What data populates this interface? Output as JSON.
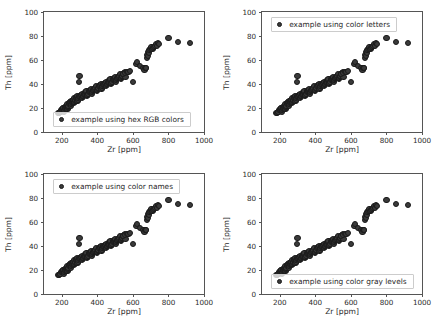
{
  "figure": {
    "width": 436,
    "height": 330,
    "background": "#ffffff",
    "marker_color": "#3a3a3a",
    "marker_edge_color": "#1a1a1a",
    "spine_color": "#555555",
    "caption": ""
  },
  "chart_data": [
    {
      "type": "scatter",
      "title": "",
      "xlabel": "Zr [ppm]",
      "ylabel": "Th [ppm]",
      "xlim": [
        100,
        1000
      ],
      "ylim": [
        0,
        100
      ],
      "xticks": [
        200,
        400,
        600,
        800,
        1000
      ],
      "yticks": [
        0,
        20,
        40,
        60,
        80,
        100
      ],
      "grid": false,
      "legend": {
        "label": "example using hex RGB colors",
        "position": "lower left"
      },
      "x": [
        182,
        186,
        190,
        193,
        196,
        199,
        202,
        205,
        208,
        210,
        212,
        214,
        216,
        219,
        221,
        223,
        225,
        228,
        230,
        232,
        234,
        236,
        238,
        240,
        242,
        244,
        246,
        248,
        250,
        252,
        254,
        256,
        258,
        260,
        262,
        264,
        266,
        268,
        270,
        272,
        274,
        276,
        278,
        280,
        282,
        284,
        286,
        288,
        290,
        292,
        295,
        298,
        300,
        303,
        306,
        309,
        312,
        315,
        318,
        321,
        324,
        327,
        330,
        333,
        336,
        339,
        342,
        345,
        348,
        351,
        354,
        357,
        360,
        363,
        366,
        369,
        372,
        375,
        378,
        381,
        384,
        387,
        390,
        393,
        396,
        399,
        402,
        405,
        408,
        411,
        414,
        417,
        420,
        423,
        426,
        429,
        432,
        435,
        438,
        441,
        444,
        447,
        450,
        453,
        456,
        459,
        462,
        465,
        468,
        471,
        474,
        477,
        480,
        483,
        486,
        489,
        492,
        495,
        498,
        501,
        504,
        507,
        510,
        513,
        516,
        519,
        522,
        525,
        528,
        531,
        534,
        537,
        540,
        543,
        546,
        549,
        552,
        555,
        558,
        300,
        545,
        555,
        565,
        575,
        585,
        600,
        620,
        625,
        640,
        660,
        665,
        670,
        672,
        675,
        678,
        681,
        684,
        687,
        690,
        693,
        696,
        700,
        705,
        710,
        715,
        720,
        725,
        730,
        735,
        740,
        745,
        800,
        855,
        920
      ],
      "y": [
        16,
        16,
        17,
        17,
        18,
        18,
        19,
        19,
        20,
        20,
        17,
        18,
        19,
        20,
        21,
        21,
        22,
        22,
        23,
        19,
        20,
        21,
        22,
        23,
        24,
        24,
        25,
        25,
        26,
        22,
        23,
        24,
        25,
        26,
        26,
        27,
        27,
        28,
        24,
        25,
        26,
        27,
        28,
        28,
        29,
        29,
        30,
        26,
        27,
        28,
        29,
        42,
        30,
        30,
        31,
        31,
        32,
        28,
        29,
        30,
        31,
        32,
        32,
        33,
        33,
        34,
        30,
        31,
        32,
        33,
        34,
        34,
        35,
        35,
        36,
        32,
        33,
        34,
        35,
        36,
        36,
        37,
        37,
        38,
        34,
        35,
        36,
        37,
        38,
        38,
        39,
        39,
        40,
        36,
        37,
        38,
        39,
        40,
        40,
        41,
        41,
        42,
        38,
        39,
        40,
        41,
        42,
        42,
        43,
        43,
        44,
        40,
        41,
        42,
        43,
        44,
        44,
        45,
        45,
        46,
        42,
        43,
        44,
        45,
        46,
        46,
        47,
        47,
        48,
        44,
        45,
        46,
        47,
        48,
        48,
        49,
        49,
        50,
        46,
        47,
        48,
        49,
        50,
        50,
        51,
        42,
        57,
        58,
        55,
        53,
        52,
        53,
        53,
        53,
        62,
        64,
        63,
        67,
        66,
        68,
        69,
        70,
        71,
        69,
        70,
        71,
        72,
        73,
        72,
        74,
        73,
        78,
        75,
        74,
        72,
        73,
        74,
        89,
        92
      ]
    },
    {
      "type": "scatter",
      "title": "",
      "xlabel": "Zr [ppm]",
      "ylabel": "Th [ppm]",
      "xlim": [
        100,
        1000
      ],
      "ylim": [
        0,
        100
      ],
      "xticks": [
        200,
        400,
        600,
        800,
        1000
      ],
      "yticks": [
        0,
        20,
        40,
        60,
        80,
        100
      ],
      "grid": false,
      "legend": {
        "label": "example using color letters",
        "position": "upper left"
      }
    },
    {
      "type": "scatter",
      "title": "",
      "xlabel": "Zr [ppm]",
      "ylabel": "Th [ppm]",
      "xlim": [
        100,
        1000
      ],
      "ylim": [
        0,
        100
      ],
      "xticks": [
        200,
        400,
        600,
        800,
        1000
      ],
      "yticks": [
        0,
        20,
        40,
        60,
        80,
        100
      ],
      "grid": false,
      "legend": {
        "label": "example using color names",
        "position": "upper left"
      }
    },
    {
      "type": "scatter",
      "title": "",
      "xlabel": "Zr [ppm]",
      "ylabel": "Th [ppm]",
      "xlim": [
        100,
        1000
      ],
      "ylim": [
        0,
        100
      ],
      "xticks": [
        200,
        400,
        600,
        800,
        1000
      ],
      "yticks": [
        0,
        20,
        40,
        60,
        80,
        100
      ],
      "grid": false,
      "legend": {
        "label": "example using color gray levels",
        "position": "lower left"
      }
    }
  ]
}
